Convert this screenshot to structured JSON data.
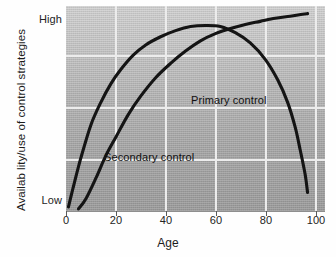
{
  "chart_data": {
    "type": "line",
    "title": "",
    "xlabel": "Age",
    "ylabel": "Availab lity/use of control strategies",
    "xlim": [
      0,
      104
    ],
    "ylim": [
      0,
      100
    ],
    "xticks": [
      0,
      20,
      40,
      60,
      80,
      100
    ],
    "xtick_labels": [
      "0",
      "20",
      "40",
      "60",
      "80",
      "100"
    ],
    "ytick_labels": [
      "High",
      "Low"
    ],
    "ytick_positions": [
      100,
      4
    ],
    "grid": true,
    "grid_color": "#ececec",
    "legend_position": "inline-annotations",
    "line_color": "#141414",
    "background_top": "#d2d2d2",
    "background_bottom": "#9d9d9d",
    "series": [
      {
        "name": "Primary control",
        "label_x": 58,
        "label_y": 52,
        "description": "Rises steeply from low in infancy, peaks in midlife, then declines sharply in old age",
        "x": [
          1,
          3,
          6,
          10,
          14,
          18,
          22,
          27,
          32,
          38,
          44,
          50,
          56,
          62,
          68,
          74,
          80,
          85,
          89,
          92,
          94,
          96,
          97
        ],
        "y": [
          2,
          12,
          26,
          42,
          53,
          62,
          69,
          76,
          81,
          85,
          88,
          90,
          90.5,
          90,
          87,
          82,
          74,
          64,
          53,
          41,
          30,
          18,
          9
        ]
      },
      {
        "name": "Secondary control",
        "label_x": 22,
        "label_y": 27,
        "description": "Rises gradually from low in childhood and continues increasing, approaching high in old age",
        "x": [
          5,
          8,
          12,
          16,
          20,
          25,
          30,
          36,
          42,
          48,
          54,
          60,
          66,
          72,
          78,
          84,
          90,
          95,
          97
        ],
        "y": [
          1,
          6,
          16,
          27,
          36,
          47,
          56,
          65,
          72,
          78,
          83,
          86.5,
          89,
          91,
          92.5,
          94,
          95,
          96,
          96.3
        ]
      }
    ],
    "annotations": [
      {
        "text": "Primary control",
        "x": 58,
        "y": 52
      },
      {
        "text": "Secondary control",
        "x": 22,
        "y": 27
      }
    ]
  }
}
